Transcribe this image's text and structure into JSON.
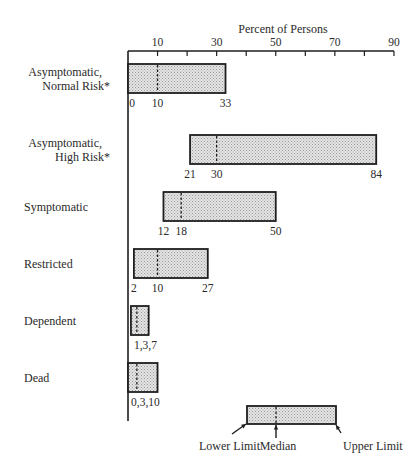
{
  "chart_data": {
    "type": "bar",
    "subtype": "floating-range (lower limit, median, upper limit)",
    "title": "Percent of Persons",
    "xlabel": "Percent of Persons",
    "ylabel": "",
    "xlim": [
      0,
      90
    ],
    "x_ticks": [
      10,
      20,
      30,
      40,
      50,
      60,
      70,
      80,
      90
    ],
    "x_tick_labels": [
      "10",
      "30",
      "50",
      "70",
      "90"
    ],
    "grid": false,
    "categories": [
      "Asymptomatic, Normal Risk*",
      "Asymptomatic, High Risk*",
      "Symptomatic",
      "Restricted",
      "Dependent",
      "Dead"
    ],
    "series": [
      {
        "name": "Lower Limit",
        "values": [
          0,
          21,
          12,
          2,
          1,
          0
        ]
      },
      {
        "name": "Median",
        "values": [
          10,
          30,
          18,
          10,
          3,
          3
        ]
      },
      {
        "name": "Upper Limit",
        "values": [
          33,
          84,
          50,
          27,
          7,
          10
        ]
      }
    ],
    "rows": [
      {
        "label_lines": [
          "Asymptomatic,",
          "Normal Risk*"
        ],
        "low": 0,
        "median": 10,
        "high": 33,
        "value_labels": [
          "0",
          "10",
          "33"
        ],
        "combined": false
      },
      {
        "label_lines": [
          "Asymptomatic,",
          "High Risk*"
        ],
        "low": 21,
        "median": 30,
        "high": 84,
        "value_labels": [
          "21",
          "30",
          "84"
        ],
        "combined": false
      },
      {
        "label_lines": [
          "Symptomatic"
        ],
        "low": 12,
        "median": 18,
        "high": 50,
        "value_labels": [
          "12",
          "18",
          "50"
        ],
        "combined": false
      },
      {
        "label_lines": [
          "Restricted"
        ],
        "low": 2,
        "median": 10,
        "high": 27,
        "value_labels": [
          "2",
          "10",
          "27"
        ],
        "combined": false
      },
      {
        "label_lines": [
          "Dependent"
        ],
        "low": 1,
        "median": 3,
        "high": 7,
        "value_labels": [
          "1,3,7"
        ],
        "combined": true
      },
      {
        "label_lines": [
          "Dead"
        ],
        "low": 0,
        "median": 3,
        "high": 10,
        "value_labels": [
          "0,3,10"
        ],
        "combined": true
      }
    ],
    "legend": {
      "position": "bottom-right",
      "labels": {
        "lower": "Lower Limit",
        "median": "Median",
        "upper": "Upper Limit"
      }
    }
  },
  "colors": {
    "line": "#1e1e1e",
    "fill_light": "#e2e2e2",
    "fill_dot": "#9a9a9a",
    "text": "#2a2a2a"
  }
}
